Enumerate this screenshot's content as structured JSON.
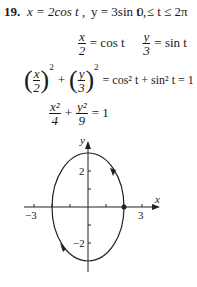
{
  "problem": {
    "number": "19.",
    "statement": {
      "x_eq": "x = 2cos t ,",
      "y_eq": "y = 3sin t ,",
      "range": "0 ≤ t ≤ 2π"
    },
    "steps": [
      {
        "lhs_num": "x",
        "lhs_den": "2",
        "rhs": "= cos t",
        "lhs2_num": "y",
        "lhs2_den": "3",
        "rhs2": "= sin t"
      },
      {
        "a_num": "x",
        "a_den": "2",
        "b_num": "y",
        "b_den": "3",
        "exp": "2",
        "plus": "+",
        "rhs": "= cos² t + sin² t = 1"
      },
      {
        "a_num": "x²",
        "a_den": "4",
        "plus": "+",
        "b_num": "y²",
        "b_den": "9",
        "rhs": "= 1"
      }
    ]
  },
  "graph": {
    "x_label": "x",
    "y_label": "y",
    "x_ticks": [
      "−3",
      "3"
    ],
    "y_ticks": [
      "2",
      "−2"
    ],
    "curve": "ellipse x²/4 + y²/9 = 1",
    "start_point": [
      2,
      0
    ],
    "direction": "counterclockwise"
  }
}
